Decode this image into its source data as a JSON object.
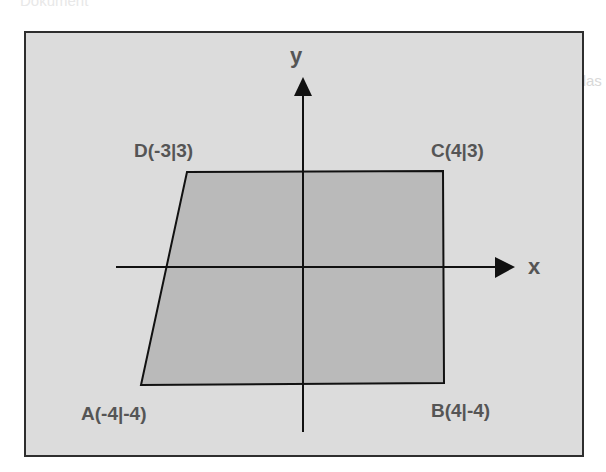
{
  "ghost_text": {
    "top_left": "Dokument",
    "line1": "Gegeben ist ein gleichmäßiger Verlauf und das",
    "line2": "Trapez (Rechteck) mit Fläche ... cm²",
    "line3": "Aufgaben durchführen"
  },
  "diagram": {
    "type": "coordinate-system-quadrilateral",
    "axes": {
      "x_label": "x",
      "y_label": "y"
    },
    "points": [
      {
        "name": "A",
        "label": "A(-4|-4)",
        "x": -4,
        "y": -4
      },
      {
        "name": "B",
        "label": "B(4|-4)",
        "x": 4,
        "y": -4
      },
      {
        "name": "C",
        "label": "C(4|3)",
        "x": 4,
        "y": 3
      },
      {
        "name": "D",
        "label": "D(-3|3)",
        "x": -3,
        "y": 3
      }
    ],
    "colors": {
      "background": "#dcdcdc",
      "shape_fill": "#b4b4b4",
      "lines": "#111111",
      "labels": "#555555",
      "frame": "#2e2e2e"
    }
  }
}
